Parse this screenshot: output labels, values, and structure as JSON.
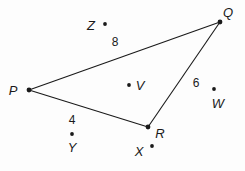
{
  "figure": {
    "type": "geometry-triangle-diagram",
    "background_color": "#fdfdfd",
    "stroke_color": "#1a1a1a",
    "text_color": "#1a1a1a",
    "width": 245,
    "height": 171,
    "triangle": {
      "name": "triangle-PQR",
      "vertices": [
        {
          "label": "P",
          "x": 29,
          "y": 90,
          "label_x": 13,
          "label_y": 90
        },
        {
          "label": "Q",
          "x": 220,
          "y": 22,
          "label_x": 228,
          "label_y": 12
        },
        {
          "label": "R",
          "x": 148,
          "y": 127,
          "label_x": 160,
          "label_y": 133
        }
      ],
      "sides": [
        {
          "name": "side-PQ",
          "from": "P",
          "to": "Q",
          "length_label": "8",
          "label_x": 115,
          "label_y": 42
        },
        {
          "name": "side-PR",
          "from": "P",
          "to": "R",
          "length_label": "4",
          "label_x": 72,
          "label_y": 120
        },
        {
          "name": "side-QR",
          "from": "Q",
          "to": "R",
          "length_label": "6",
          "label_x": 196,
          "label_y": 83
        }
      ]
    },
    "points": [
      {
        "label": "Z",
        "dot_x": 105,
        "dot_y": 24,
        "label_x": 91,
        "label_y": 25
      },
      {
        "label": "V",
        "dot_x": 129,
        "dot_y": 85,
        "label_x": 140,
        "label_y": 85
      },
      {
        "label": "W",
        "dot_x": 214,
        "dot_y": 89,
        "label_x": 218,
        "label_y": 103
      },
      {
        "label": "Y",
        "dot_x": 72,
        "dot_y": 134,
        "label_x": 72,
        "label_y": 147
      },
      {
        "label": "X",
        "dot_x": 152,
        "dot_y": 146,
        "label_x": 139,
        "label_y": 151
      }
    ]
  }
}
